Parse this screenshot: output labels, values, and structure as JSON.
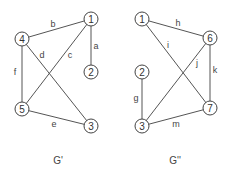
{
  "diagram": {
    "graphs": [
      {
        "title": "G'",
        "title_pos": [
          58,
          162
        ],
        "nodes": [
          {
            "id": "1",
            "x": 91,
            "y": 19
          },
          {
            "id": "2",
            "x": 91,
            "y": 72
          },
          {
            "id": "3",
            "x": 91,
            "y": 126
          },
          {
            "id": "4",
            "x": 22,
            "y": 39
          },
          {
            "id": "5",
            "x": 22,
            "y": 109
          }
        ],
        "edges": [
          {
            "label": "a",
            "from": "1",
            "to": "2",
            "lx": 96,
            "ly": 46
          },
          {
            "label": "b",
            "from": "4",
            "to": "1",
            "lx": 53,
            "ly": 24
          },
          {
            "label": "c",
            "from": "1",
            "to": "5",
            "lx": 70,
            "ly": 55
          },
          {
            "label": "d",
            "from": "4",
            "to": "3",
            "lx": 42,
            "ly": 55
          },
          {
            "label": "e",
            "from": "5",
            "to": "3",
            "lx": 54,
            "ly": 124
          },
          {
            "label": "f",
            "from": "4",
            "to": "5",
            "lx": 15,
            "ly": 72
          }
        ]
      },
      {
        "title": "G''",
        "title_pos": [
          175,
          162
        ],
        "nodes": [
          {
            "id": "1",
            "x": 142,
            "y": 19
          },
          {
            "id": "2",
            "x": 142,
            "y": 72
          },
          {
            "id": "3",
            "x": 142,
            "y": 126
          },
          {
            "id": "6",
            "x": 210,
            "y": 38
          },
          {
            "id": "7",
            "x": 210,
            "y": 108
          }
        ],
        "edges": [
          {
            "label": "h",
            "from": "1",
            "to": "6",
            "lx": 178,
            "ly": 23
          },
          {
            "label": "i",
            "from": "1",
            "to": "7",
            "lx": 168,
            "ly": 45
          },
          {
            "label": "j",
            "from": "6",
            "to": "3",
            "lx": 197,
            "ly": 63
          },
          {
            "label": "k",
            "from": "6",
            "to": "7",
            "lx": 215,
            "ly": 70
          },
          {
            "label": "g",
            "from": "2",
            "to": "3",
            "lx": 136,
            "ly": 98
          },
          {
            "label": "m",
            "from": "3",
            "to": "7",
            "lx": 176,
            "ly": 124
          }
        ]
      }
    ],
    "node_radius": 7,
    "colors": {
      "edge": "#555555",
      "node_stroke": "#444444",
      "text": "#333333",
      "background": "#ffffff"
    }
  }
}
